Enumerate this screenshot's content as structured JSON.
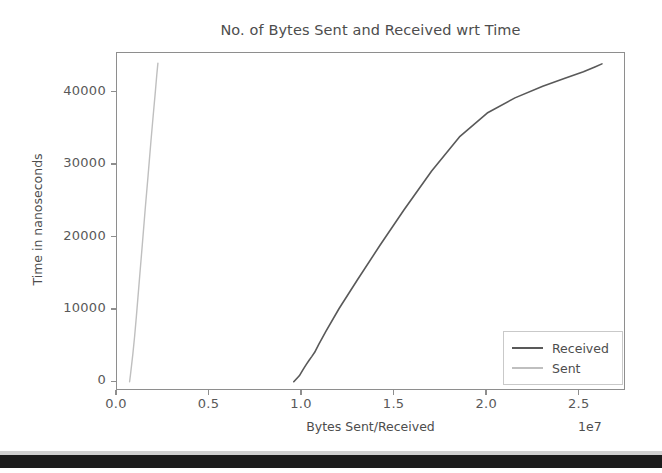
{
  "chart_data": {
    "type": "line",
    "title": "No. of Bytes Sent and Received wrt Time",
    "xlabel": "Bytes Sent/Received",
    "ylabel": "Time in nanoseconds",
    "x_offset_text": "1e7",
    "x_offset_multiplier": 10000000,
    "grid": false,
    "legend_position": "lower right",
    "xlim": [
      0,
      2.75
    ],
    "ylim": [
      -1200,
      45500
    ],
    "xticks": [
      0.0,
      0.5,
      1.0,
      1.5,
      2.0,
      2.5
    ],
    "xticklabels": [
      "0.0",
      "0.5",
      "1.0",
      "1.5",
      "2.0",
      "2.5"
    ],
    "yticks": [
      0,
      10000,
      20000,
      30000,
      40000
    ],
    "yticklabels": [
      "0",
      "10000",
      "20000",
      "30000",
      "40000"
    ],
    "series": [
      {
        "name": "Received",
        "color": "#595959",
        "linewidth": 1.6,
        "x": [
          0.955,
          0.985,
          1.005,
          1.022,
          1.038,
          1.052,
          1.068,
          1.09,
          1.13,
          1.2,
          1.3,
          1.42,
          1.55,
          1.7,
          1.85,
          2.0,
          2.15,
          2.3,
          2.42,
          2.52,
          2.585,
          2.62
        ],
        "y": [
          80,
          900,
          1750,
          2450,
          3050,
          3550,
          4150,
          5250,
          7100,
          10200,
          14200,
          18900,
          23800,
          29200,
          33900,
          37200,
          39300,
          40900,
          42000,
          42900,
          43600,
          44000
        ]
      },
      {
        "name": "Sent",
        "color": "#bfbfbf",
        "linewidth": 1.4,
        "x": [
          0.068,
          0.072,
          0.078,
          0.086,
          0.095,
          0.104,
          0.113,
          0.124,
          0.137,
          0.152,
          0.168,
          0.183,
          0.196,
          0.207,
          0.215,
          0.221
        ],
        "y": [
          80,
          900,
          2200,
          4000,
          6300,
          8900,
          11700,
          15100,
          19100,
          23800,
          28600,
          33200,
          37000,
          40100,
          42500,
          44100
        ]
      }
    ]
  },
  "axes": {
    "x_ticks": [
      {
        "label": "0.0"
      },
      {
        "label": "0.5"
      },
      {
        "label": "1.0"
      },
      {
        "label": "1.5"
      },
      {
        "label": "2.0"
      },
      {
        "label": "2.5"
      }
    ],
    "y_ticks": [
      {
        "label": "40000"
      },
      {
        "label": "30000"
      },
      {
        "label": "20000"
      },
      {
        "label": "10000"
      },
      {
        "label": "0"
      }
    ]
  },
  "legend": {
    "entries": [
      {
        "label": "Received",
        "color": "#595959"
      },
      {
        "label": "Sent",
        "color": "#bfbfbf"
      }
    ]
  },
  "colors": {
    "axis": "#8e8e8e",
    "text": "#4d4d4d",
    "received": "#595959",
    "sent": "#bfbfbf",
    "background": "#ffffff"
  }
}
